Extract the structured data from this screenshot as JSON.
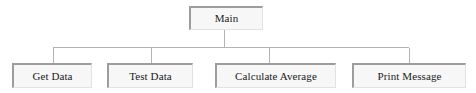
{
  "diagram": {
    "type": "hierarchy-chart",
    "colors": {
      "background": "#ffffff",
      "node_fill": "#f7f7f7",
      "node_shadow_border": "#9d9d9d",
      "node_light_border": "#e2e2e2",
      "connector_line": "#b3b3b3",
      "label_text": "#1a1a1a"
    },
    "root": {
      "id": "main",
      "label": "Main"
    },
    "children": [
      {
        "id": "get-data",
        "label": "Get Data"
      },
      {
        "id": "test-data",
        "label": "Test Data"
      },
      {
        "id": "calculate-average",
        "label": "Calculate Average"
      },
      {
        "id": "print-message",
        "label": "Print Message"
      }
    ],
    "connectors": {
      "stem_from_root": {
        "x": 224,
        "y1": 30,
        "y2": 47
      },
      "horizontal_bar": {
        "y": 47,
        "x1": 53,
        "x2": 409
      },
      "drops": [
        {
          "x": 53,
          "y1": 47,
          "y2": 63
        },
        {
          "x": 151,
          "y1": 47,
          "y2": 63
        },
        {
          "x": 269,
          "y1": 47,
          "y2": 63
        },
        {
          "x": 409,
          "y1": 47,
          "y2": 63
        }
      ]
    }
  }
}
